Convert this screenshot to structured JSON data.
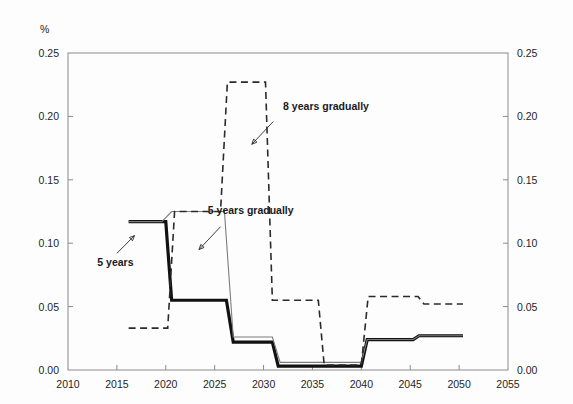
{
  "chart_data": {
    "type": "line",
    "title": "",
    "subtitle": "",
    "xlabel": "",
    "ylabel": "%",
    "unit_label": "%",
    "xlim": [
      2010,
      2055
    ],
    "ylim": [
      0.0,
      0.25
    ],
    "xticks": [
      2010,
      2015,
      2020,
      2025,
      2030,
      2035,
      2040,
      2045,
      2050,
      2055
    ],
    "yticks": [
      0.0,
      0.05,
      0.1,
      0.15,
      0.2,
      0.25
    ],
    "xtick_labels": [
      "2010",
      "2015",
      "2020",
      "2025",
      "2030",
      "2035",
      "2040",
      "2045",
      "2050",
      "2055"
    ],
    "ytick_labels": [
      "0.00",
      "0.05",
      "0.10",
      "0.15",
      "0.20",
      "0.25"
    ],
    "ytick_labels_right": [
      "0.00",
      "0.05",
      "0.10",
      "0.15",
      "0.20",
      "0.25"
    ],
    "grid": false,
    "legend": "none",
    "annotations": [
      {
        "text": "8 years gradually",
        "x": 2032.0,
        "y": 0.205,
        "series": "8 years gradually",
        "leader_from": [
          2031.0,
          0.196
        ],
        "leader_to": [
          2028.8,
          0.178
        ]
      },
      {
        "text": "5 years gradually",
        "x": 2024.3,
        "y": 0.123,
        "series": "5 years gradually",
        "leader_from": [
          2025.6,
          0.113
        ],
        "leader_to": [
          2023.4,
          0.095
        ]
      },
      {
        "text": "5 years",
        "x": 2013.0,
        "y": 0.082,
        "series": "5 years",
        "leader_from": [
          2015.0,
          0.092
        ],
        "leader_to": [
          2016.8,
          0.106
        ]
      }
    ],
    "series": [
      {
        "name": "5 years",
        "style": "thick-solid",
        "color": "#111111",
        "step": true,
        "x": [
          2016.2,
          2020.0,
          2020.6,
          2021.0,
          2026.2,
          2026.9,
          2030.9,
          2031.5,
          2040.0,
          2040.6,
          2045.3,
          2045.9,
          2050.4
        ],
        "values": [
          0.117,
          0.117,
          0.055,
          0.055,
          0.055,
          0.022,
          0.022,
          0.003,
          0.003,
          0.024,
          0.024,
          0.027,
          0.027
        ]
      },
      {
        "name": "5 years gradually",
        "style": "thin-solid",
        "color": "#7d7d7d",
        "step": true,
        "x": [
          2016.2,
          2019.6,
          2020.6,
          2026.0,
          2026.9,
          2030.9,
          2031.7,
          2040.0,
          2040.6,
          2045.3,
          2045.9,
          2050.4
        ],
        "values": [
          0.117,
          0.117,
          0.125,
          0.125,
          0.026,
          0.026,
          0.006,
          0.006,
          0.024,
          0.024,
          0.027,
          0.027
        ]
      },
      {
        "name": "8 years gradually",
        "style": "dashed",
        "color": "#2b2b2b",
        "step": true,
        "x": [
          2016.2,
          2020.2,
          2020.9,
          2025.6,
          2026.3,
          2030.2,
          2030.9,
          2035.6,
          2036.2,
          2040.0,
          2040.7,
          2045.8,
          2046.4,
          2050.4
        ],
        "values": [
          0.033,
          0.033,
          0.125,
          0.125,
          0.227,
          0.227,
          0.055,
          0.055,
          0.004,
          0.004,
          0.058,
          0.058,
          0.052,
          0.052
        ]
      }
    ]
  },
  "layout": {
    "plot_left": 68,
    "plot_right": 508,
    "plot_top": 53,
    "plot_bottom": 370
  }
}
